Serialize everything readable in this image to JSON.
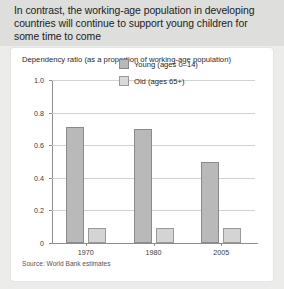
{
  "header": {
    "title": "In contrast, the working-age population in developing countries will continue to support young children for some time to come"
  },
  "card": {
    "subtitle": "Dependency ratio (as a proportion of working-age population)",
    "source": "Source: World Bank estimates"
  },
  "chart_data": {
    "type": "bar",
    "title": "Dependency ratio (as a proportion of working-age population)",
    "xlabel": "",
    "ylabel": "",
    "categories": [
      "1970",
      "1980",
      "2005"
    ],
    "series": [
      {
        "name": "Young (ages 0–14)",
        "values": [
          0.71,
          0.7,
          0.5
        ],
        "color": "#b9b9b9"
      },
      {
        "name": "Old (ages 65+)",
        "values": [
          0.09,
          0.09,
          0.09
        ],
        "color": "#d4d4d4"
      }
    ],
    "ylim": [
      0,
      1.0
    ],
    "ytick_labels": [
      "0",
      "0.2",
      "0.4",
      "0.6",
      "0.8",
      "1.0"
    ],
    "ytick_values": [
      0,
      0.2,
      0.4,
      0.6,
      0.8,
      1.0
    ],
    "grid": true,
    "legend_position": "inside-top-right",
    "source": "Source: World Bank estimates"
  }
}
